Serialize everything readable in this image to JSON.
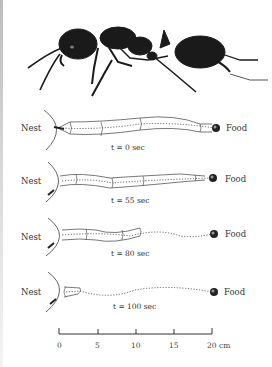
{
  "figure": {
    "labels": {
      "nest": "Nest",
      "food": "Food"
    },
    "panels": [
      {
        "time_label": "t = 0 sec",
        "y": 128
      },
      {
        "time_label": "t = 55 sec",
        "y": 179
      },
      {
        "time_label": "t = 80 sec",
        "y": 234
      },
      {
        "time_label": "t = 100 sec",
        "y": 292
      }
    ],
    "scale_bar": {
      "ticks": [
        "0",
        "5",
        "10",
        "15",
        "20 cm"
      ]
    }
  }
}
